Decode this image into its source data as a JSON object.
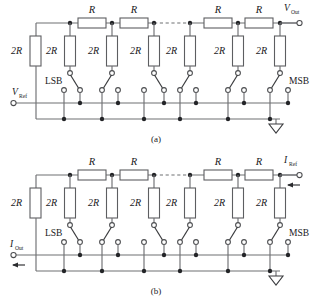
{
  "figure": {
    "background_color": "#ffffff",
    "wire_color": "#6f7073",
    "node_color": "#232427",
    "text_color": "#18191c"
  },
  "labels": {
    "series_resistor": "R",
    "shunt_resistor": "2R",
    "lsb": "LSB",
    "msb": "MSB"
  },
  "panel_a": {
    "caption": "(a)",
    "input_terminal": {
      "name": "V",
      "subscript": "Ref",
      "position": "left"
    },
    "output_terminal": {
      "name": "V",
      "subscript": "Out",
      "position": "top-right"
    },
    "series_resistors": [
      "R",
      "R",
      "R",
      "R"
    ],
    "shunt_resistors": [
      "2R",
      "2R",
      "2R",
      "2R",
      "2R",
      "2R",
      "2R"
    ],
    "bit_labels": [
      "LSB",
      "MSB"
    ],
    "ground": "ground-symbol",
    "ellipsis": "dashed-continuation"
  },
  "panel_b": {
    "caption": "(b)",
    "input_terminal": {
      "name": "I",
      "subscript": "Ref",
      "position": "top-right",
      "current_direction": "in"
    },
    "output_terminal": {
      "name": "I",
      "subscript": "Out",
      "position": "left",
      "current_direction": "out"
    },
    "series_resistors": [
      "R",
      "R",
      "R",
      "R"
    ],
    "shunt_resistors": [
      "2R",
      "2R",
      "2R",
      "2R",
      "2R",
      "2R",
      "2R"
    ],
    "bit_labels": [
      "LSB",
      "MSB"
    ],
    "ground": "ground-symbol",
    "ellipsis": "dashed-continuation"
  }
}
